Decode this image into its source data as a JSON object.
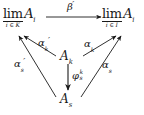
{
  "diagram": {
    "type": "commutative-diagram",
    "background_color": "#ffffff",
    "ink_color": "#1a1a1a",
    "nodes": {
      "limit_left": {
        "operator": "lim",
        "index": "i ∈ K",
        "body": "A",
        "body_subscript": "i"
      },
      "limit_right": {
        "operator": "lim",
        "index": "i ∈ I",
        "body": "A",
        "body_subscript": "i"
      },
      "object_middle": {
        "body": "A",
        "subscript": "k"
      },
      "object_bottom": {
        "body": "A",
        "subscript": "s"
      }
    },
    "arrows": {
      "beta_prime": {
        "letter": "β",
        "prime": "′",
        "from": "limit_left",
        "to": "limit_right"
      },
      "alpha_k_prime": {
        "letter": "α",
        "subscript": "k",
        "prime": "′",
        "from": "object_middle",
        "to": "limit_left"
      },
      "alpha_s_prime": {
        "letter": "α",
        "subscript": "s",
        "prime": "′",
        "from": "object_bottom",
        "to": "limit_left"
      },
      "alpha_k": {
        "letter": "α",
        "subscript": "k",
        "from": "object_middle",
        "to": "limit_right"
      },
      "alpha_s": {
        "letter": "α",
        "subscript": "s",
        "from": "object_bottom",
        "to": "limit_right"
      },
      "phi": {
        "letter": "φ",
        "superscript": "k",
        "subscript": "s",
        "from": "object_middle",
        "to": "object_bottom"
      }
    }
  }
}
